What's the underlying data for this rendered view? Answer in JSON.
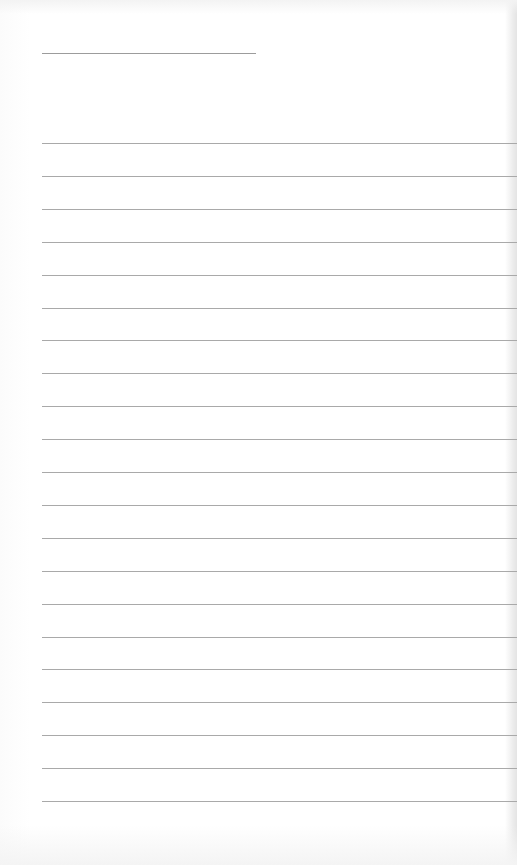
{
  "document": {
    "type": "lined-paper",
    "header_line": {
      "top": 53,
      "left": 42,
      "width": 214
    },
    "ruled_lines": {
      "count": 21,
      "first_top": 143,
      "spacing": 32.9,
      "left": 42
    },
    "colors": {
      "paper": "#ffffff",
      "line": "#a9a9a9"
    }
  }
}
